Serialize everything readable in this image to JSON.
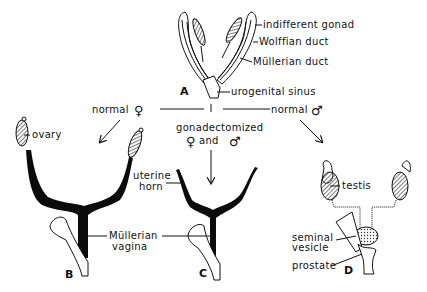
{
  "diagram": {
    "panels": {
      "A": {
        "letter": "A",
        "labels": {
          "indifferent_gonad": "indifferent gonad",
          "wolffian_duct": "Wolffian duct",
          "mullerian_duct": "Müllerian duct",
          "urogenital_sinus": "urogenital sinus"
        }
      },
      "B": {
        "letter": "B",
        "labels": {
          "ovary": "ovary"
        }
      },
      "C": {
        "letter": "C",
        "labels": {
          "uterine_horn_1": "uterine",
          "uterine_horn_2": "horn",
          "mullerian_vagina_1": "Müllerian",
          "mullerian_vagina_2": "vagina"
        }
      },
      "D": {
        "letter": "D",
        "labels": {
          "testis": "testis",
          "seminal_vesicle_1": "seminal",
          "seminal_vesicle_2": "vesicle",
          "prostate": "prostate"
        }
      }
    },
    "pathways": {
      "female": {
        "text": "normal",
        "symbol": "♀"
      },
      "castrated": {
        "line1": "gonadectomized",
        "female_symbol": "♀",
        "and": "and",
        "male_symbol": "♂"
      },
      "male": {
        "text": "normal",
        "symbol": "♂"
      }
    }
  }
}
